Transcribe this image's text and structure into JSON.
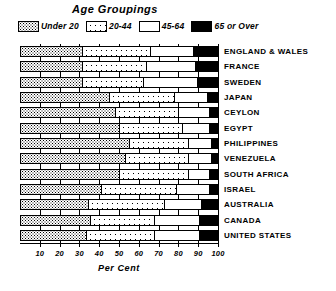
{
  "chart_data": {
    "type": "bar",
    "title": "Age  Groupings",
    "xlabel": "Per Cent",
    "ylabel": "",
    "orientation": "horizontal",
    "stacked": true,
    "stack_total": 100,
    "xlim": [
      0,
      100
    ],
    "xticks": [
      10,
      20,
      30,
      40,
      50,
      60,
      70,
      80,
      90,
      100
    ],
    "xtick_labels": [
      "10",
      "20",
      "30",
      "40",
      "50",
      "60",
      "70",
      "80",
      "90",
      "100"
    ],
    "grid": true,
    "legend_position": "top",
    "legend": [
      "Under 20",
      "20-44",
      "45-64",
      "65 or Over"
    ],
    "categories": [
      "ENGLAND & WALES",
      "FRANCE",
      "SWEDEN",
      "JAPAN",
      "CEYLON",
      "EGYPT",
      "PHILIPPINES",
      "VENEZUELA",
      "SOUTH  AFRICA",
      "ISRAEL",
      "AUSTRALIA",
      "CANADA",
      "UNITED  STATES"
    ],
    "series": [
      {
        "name": "Under 20",
        "pattern": "fine-stipple",
        "values": [
          31,
          31,
          31,
          45,
          48,
          50,
          55,
          53,
          50,
          41,
          34,
          35,
          33
        ]
      },
      {
        "name": "20-44",
        "pattern": "coarse-dots",
        "values": [
          35,
          33,
          31,
          33,
          32,
          32,
          30,
          32,
          35,
          38,
          39,
          33,
          35
        ]
      },
      {
        "name": "45-64",
        "pattern": "white",
        "values": [
          22,
          25,
          28,
          17,
          16,
          14,
          12,
          12,
          11,
          17,
          19,
          23,
          23
        ]
      },
      {
        "name": "65 or Over",
        "pattern": "solid-black",
        "values": [
          12,
          11,
          10,
          5,
          4,
          4,
          3,
          3,
          4,
          4,
          8,
          9,
          9
        ]
      }
    ]
  },
  "colors": {
    "ink": "#000000",
    "paper": "#ffffff"
  }
}
